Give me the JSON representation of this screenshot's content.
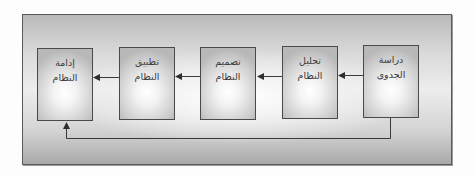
{
  "diagram": {
    "type": "flowchart",
    "title": "",
    "direction": "right-to-left",
    "stages": [
      {
        "id": "feasibility",
        "label": "دراسة الجدوى",
        "line1": "دراسة",
        "line2": "الجدوى"
      },
      {
        "id": "analysis",
        "label": "تحليل النظام",
        "line1": "تحليل",
        "line2": "النظام"
      },
      {
        "id": "design",
        "label": "تصميم النظام",
        "line1": "تصميم",
        "line2": "النظام"
      },
      {
        "id": "implementation",
        "label": "تطبيق النظام",
        "line1": "تطبيق",
        "line2": "النظام"
      },
      {
        "id": "maintenance",
        "label": "إدامة النظام",
        "line1": "إدامة",
        "line2": "النظام"
      }
    ],
    "edges": [
      {
        "from": "feasibility",
        "to": "analysis"
      },
      {
        "from": "analysis",
        "to": "design"
      },
      {
        "from": "design",
        "to": "implementation"
      },
      {
        "from": "implementation",
        "to": "maintenance"
      },
      {
        "from": "feasibility",
        "to": "maintenance",
        "style": "feedback-loop-below"
      }
    ],
    "colors": {
      "border": "#4a4a4a",
      "arrow": "#3a3a3a",
      "text": "#3a3a3a",
      "frame_edge": "#b9b9b9",
      "box_center": "#ffffff"
    }
  }
}
